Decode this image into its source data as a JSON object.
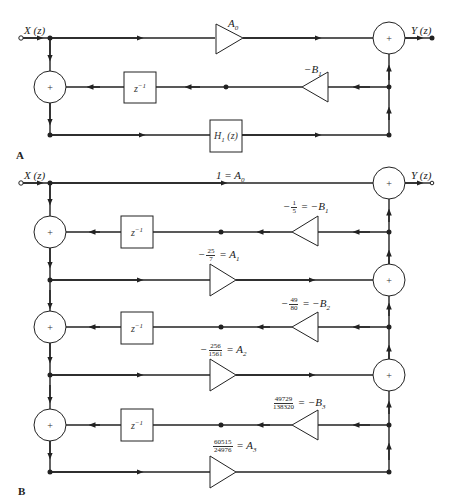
{
  "figure_a": {
    "label": "A",
    "input": "X (z)",
    "output": "Y (z)",
    "forward_gain": "A",
    "forward_gain_sub": "0",
    "feedback_gain": "−B",
    "feedback_gain_sub": "1",
    "delay": "z",
    "delay_sup": "−1",
    "block": "H",
    "block_sub": "1",
    "block_arg": " (z)",
    "adder": "+"
  },
  "figure_b": {
    "label": "B",
    "input": "X (z)",
    "output": "Y (z)",
    "direct_gain": "1 = A",
    "direct_gain_sub": "0",
    "adder": "+",
    "delay": "z",
    "delay_sup": "−1",
    "stages": [
      {
        "b_sign": "−",
        "b_num": "1",
        "b_den": "5",
        "b_rhs": "= −B",
        "b_sub": "1",
        "a_sign": "−",
        "a_num": "25",
        "a_den": "7",
        "a_rhs": "= A",
        "a_sub": "1"
      },
      {
        "b_sign": "−",
        "b_num": "49",
        "b_den": "80",
        "b_rhs": "= −B",
        "b_sub": "2",
        "a_sign": "−",
        "a_num": "256",
        "a_den": "1561",
        "a_rhs": "= A",
        "a_sub": "2"
      },
      {
        "b_sign": "",
        "b_num": "49729",
        "b_den": "138320",
        "b_rhs": "= −B",
        "b_sub": "3",
        "a_sign": "",
        "a_num": "60515",
        "a_den": "24976",
        "a_rhs": "= A",
        "a_sub": "3"
      }
    ]
  }
}
